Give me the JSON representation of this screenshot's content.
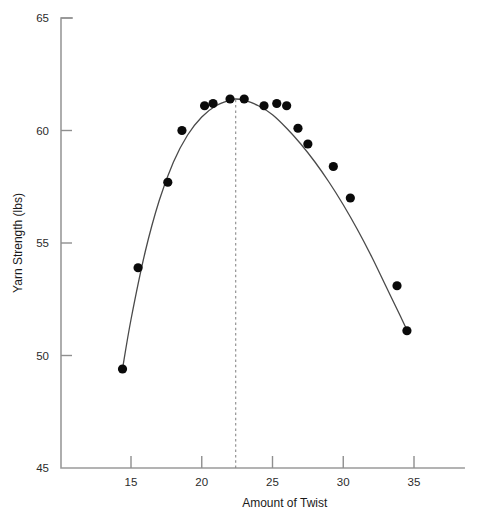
{
  "chart_data": {
    "type": "scatter",
    "title": "",
    "subtitle": "",
    "xlabel": "Amount of Twist",
    "ylabel": "Yarn Strength (lbs)",
    "xlim": [
      12.0,
      38.6
    ],
    "ylim": [
      45,
      65
    ],
    "xticks": [
      15,
      20,
      25,
      30,
      35
    ],
    "xtick_labels": [
      "15",
      "20",
      "25",
      "30",
      "35"
    ],
    "yticks": [
      45,
      50,
      55,
      60,
      65
    ],
    "ytick_labels": [
      "45",
      "50",
      "55",
      "60",
      "65"
    ],
    "grid": false,
    "legend": null,
    "marker_color": "#0a0a0a",
    "curve_color": "#4a4a4a",
    "axis_color": "#9a9a9a",
    "series": [
      {
        "name": "Observed yarn strength",
        "marker": "filled-circle",
        "points": [
          {
            "x": 14.4,
            "y": 49.4
          },
          {
            "x": 15.5,
            "y": 53.9
          },
          {
            "x": 17.6,
            "y": 57.7
          },
          {
            "x": 18.6,
            "y": 60.0
          },
          {
            "x": 20.2,
            "y": 61.1
          },
          {
            "x": 20.8,
            "y": 61.2
          },
          {
            "x": 22.0,
            "y": 61.4
          },
          {
            "x": 23.0,
            "y": 61.4
          },
          {
            "x": 24.4,
            "y": 61.1
          },
          {
            "x": 25.3,
            "y": 61.2
          },
          {
            "x": 26.0,
            "y": 61.1
          },
          {
            "x": 26.8,
            "y": 60.1
          },
          {
            "x": 27.5,
            "y": 59.4
          },
          {
            "x": 29.3,
            "y": 58.4
          },
          {
            "x": 30.5,
            "y": 57.0
          },
          {
            "x": 33.8,
            "y": 53.1
          },
          {
            "x": 34.5,
            "y": 51.1
          }
        ]
      }
    ],
    "fitted_curve": {
      "name": "Fitted quadratic response curve",
      "description": "Smooth concave curve through the scatter, maximum near twist 22.4",
      "points": [
        {
          "x": 14.4,
          "y": 49.4
        },
        {
          "x": 15.0,
          "y": 51.6
        },
        {
          "x": 16.0,
          "y": 54.6
        },
        {
          "x": 17.0,
          "y": 56.9
        },
        {
          "x": 18.0,
          "y": 58.6
        },
        {
          "x": 19.0,
          "y": 59.8
        },
        {
          "x": 20.0,
          "y": 60.6
        },
        {
          "x": 21.0,
          "y": 61.1
        },
        {
          "x": 22.0,
          "y": 61.35
        },
        {
          "x": 22.4,
          "y": 61.4
        },
        {
          "x": 23.0,
          "y": 61.35
        },
        {
          "x": 24.0,
          "y": 61.1
        },
        {
          "x": 25.0,
          "y": 60.7
        },
        {
          "x": 26.0,
          "y": 60.1
        },
        {
          "x": 27.0,
          "y": 59.4
        },
        {
          "x": 28.0,
          "y": 58.6
        },
        {
          "x": 29.0,
          "y": 57.7
        },
        {
          "x": 30.0,
          "y": 56.7
        },
        {
          "x": 31.0,
          "y": 55.6
        },
        {
          "x": 32.0,
          "y": 54.4
        },
        {
          "x": 33.0,
          "y": 53.1
        },
        {
          "x": 34.0,
          "y": 51.8
        },
        {
          "x": 34.6,
          "y": 51.0
        }
      ]
    },
    "annotations": [
      {
        "type": "vertical-reference-line",
        "name": "optimum-twist-line",
        "x": 22.4,
        "y_from": 45,
        "y_to": 61.45,
        "style": "dashed",
        "label": ""
      }
    ]
  }
}
